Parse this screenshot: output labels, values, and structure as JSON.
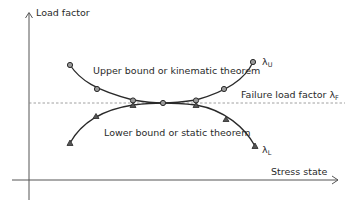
{
  "diagram": {
    "axes": {
      "y_label": "Load factor",
      "x_label": "Stress state"
    },
    "reference_line": {
      "label": "Failure load factor λ",
      "subscript": "F",
      "style": "dashed"
    },
    "upper_curve": {
      "label": "Upper bound or kinematic theorem",
      "end_symbol": "λ",
      "end_subscript": "U",
      "marker": "circle"
    },
    "lower_curve": {
      "label": "Lower bound or static theorem",
      "end_symbol": "λ",
      "end_subscript": "L",
      "marker": "triangle"
    },
    "colors": {
      "line": "#2a2a2a",
      "axis": "#555555",
      "dashed": "#888888",
      "marker_fill": "#9a9a9a"
    }
  }
}
